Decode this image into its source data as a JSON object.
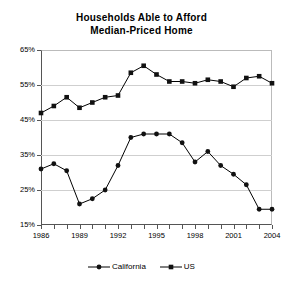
{
  "chart_data": {
    "type": "line",
    "title": "Households Able to Afford Median-Priced Home",
    "title_line1": "Households Able to Afford",
    "title_line2": "Median-Priced Home",
    "xlabel": "",
    "ylabel": "",
    "ylim": [
      15,
      65
    ],
    "ytick_values": [
      15,
      25,
      35,
      45,
      55,
      65
    ],
    "ytick_labels": [
      "15%",
      "25%",
      "35%",
      "45%",
      "55%",
      "65%"
    ],
    "grid": true,
    "legend_position": "bottom",
    "x": [
      1986,
      1987,
      1988,
      1989,
      1990,
      1991,
      1992,
      1993,
      1994,
      1995,
      1996,
      1997,
      1998,
      1999,
      2000,
      2001,
      2002,
      2003,
      2004
    ],
    "xtick_values": [
      1986,
      1989,
      1992,
      1995,
      1998,
      2001,
      2004
    ],
    "xtick_labels": [
      "1986",
      "1989",
      "1992",
      "1995",
      "1998",
      "2001",
      "2004"
    ],
    "series": [
      {
        "name": "California",
        "marker": "circle",
        "values": [
          31.0,
          32.5,
          30.5,
          21.0,
          22.5,
          25.0,
          32.0,
          40.0,
          41.0,
          41.0,
          41.0,
          38.5,
          33.0,
          36.0,
          32.0,
          29.5,
          26.5,
          19.5,
          19.5
        ]
      },
      {
        "name": "US",
        "marker": "square",
        "values": [
          47.0,
          49.0,
          51.5,
          48.5,
          50.0,
          51.5,
          52.0,
          58.5,
          60.5,
          58.0,
          56.0,
          56.0,
          55.5,
          56.5,
          56.0,
          54.5,
          57.0,
          57.5,
          55.5
        ]
      }
    ]
  },
  "legend": {
    "items": [
      {
        "label": "California",
        "marker": "circle"
      },
      {
        "label": "US",
        "marker": "square"
      }
    ]
  }
}
